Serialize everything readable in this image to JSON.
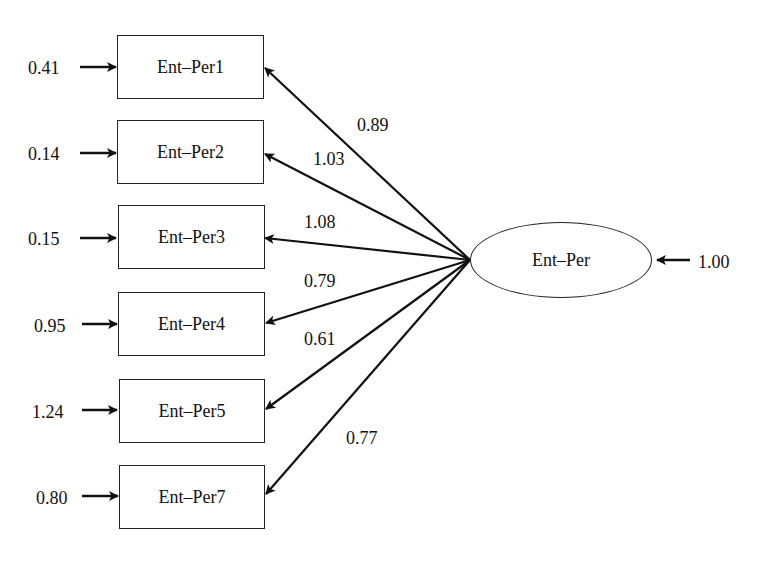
{
  "diagram": {
    "type": "cfa-path-diagram",
    "latent": {
      "label": "Ent–Per",
      "variance": "1.00"
    },
    "indicators": [
      {
        "label": "Ent–Per1",
        "error": "0.41",
        "loading": "0.89"
      },
      {
        "label": "Ent–Per2",
        "error": "0.14",
        "loading": "1.03"
      },
      {
        "label": "Ent–Per3",
        "error": "0.15",
        "loading": "1.08"
      },
      {
        "label": "Ent–Per4",
        "error": "0.95",
        "loading": "0.79"
      },
      {
        "label": "Ent–Per5",
        "error": "1.24",
        "loading": "0.61"
      },
      {
        "label": "Ent–Per7",
        "error": "0.80",
        "loading": "0.77"
      }
    ]
  }
}
